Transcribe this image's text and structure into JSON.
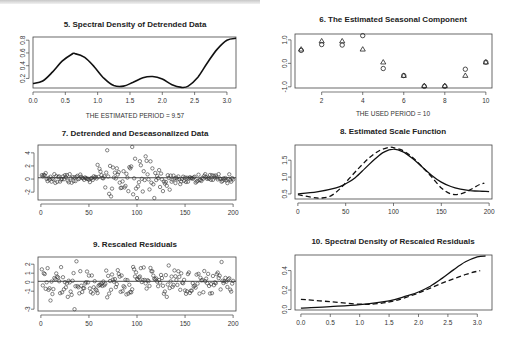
{
  "figure": {
    "panels": [
      {
        "id": "p5",
        "title": "5. Spectral Density of Detrended Data",
        "note": "THE ESTIMATED PERIOD = 9.57"
      },
      {
        "id": "p6",
        "title": "6. The Estimated Seasonal Component",
        "note": "THE USED PERIOD = 10"
      },
      {
        "id": "p7",
        "title": "7. Detrended and Deseasonalized Data"
      },
      {
        "id": "p8",
        "title": "8. Estimated Scale Function"
      },
      {
        "id": "p9",
        "title": "9. Rescaled Residuals"
      },
      {
        "id": "p10",
        "title": "10. Spectral Density of Rescaled Residuals"
      }
    ]
  },
  "chart_data": [
    {
      "type": "line",
      "title": "5. Spectral Density of Detrended Data",
      "xlabel": "",
      "ylabel": "",
      "xlim": [
        0,
        3.14
      ],
      "ylim": [
        0.05,
        0.85
      ],
      "xticks": [
        "0.0",
        "0.5",
        "1.0",
        "1.5",
        "2.0",
        "2.5",
        "3.0"
      ],
      "yticks": [
        "0.2",
        "0.4",
        "0.6",
        "0.8"
      ],
      "annotation": "THE ESTIMATED PERIOD = 9.57",
      "series": [
        {
          "name": "spectral density",
          "style": "solid",
          "x": [
            0.0,
            0.15,
            0.3,
            0.45,
            0.6,
            0.65,
            0.8,
            0.95,
            1.1,
            1.25,
            1.4,
            1.55,
            1.7,
            1.85,
            2.0,
            2.15,
            2.3,
            2.4,
            2.55,
            2.7,
            2.85,
            3.0,
            3.14
          ],
          "y": [
            0.12,
            0.16,
            0.3,
            0.47,
            0.58,
            0.59,
            0.53,
            0.38,
            0.2,
            0.09,
            0.08,
            0.14,
            0.21,
            0.23,
            0.19,
            0.1,
            0.06,
            0.08,
            0.22,
            0.45,
            0.66,
            0.8,
            0.83
          ]
        }
      ],
      "grid": false,
      "legend": null
    },
    {
      "type": "scatter",
      "title": "6. The Estimated Seasonal Component",
      "xlim": [
        0.7,
        10.3
      ],
      "ylim": [
        -1.05,
        1.25
      ],
      "xticks": [
        "2",
        "4",
        "6",
        "8",
        "10"
      ],
      "yticks": [
        "-1.0",
        "0.0",
        "1.0"
      ],
      "annotation": "THE USED PERIOD = 10",
      "series": [
        {
          "name": "circles",
          "marker": "circle",
          "x": [
            1,
            2,
            3,
            4,
            5,
            6,
            7,
            8,
            9,
            10
          ],
          "y": [
            0.55,
            0.8,
            0.78,
            1.18,
            -0.22,
            -0.52,
            -0.98,
            -0.98,
            -0.25,
            0.05
          ]
        },
        {
          "name": "triangles",
          "marker": "triangle",
          "x": [
            1,
            2,
            3,
            4,
            5,
            6,
            7,
            8,
            9,
            10
          ],
          "y": [
            0.6,
            0.95,
            0.95,
            0.6,
            0.05,
            -0.52,
            -0.95,
            -0.95,
            -0.52,
            0.05
          ]
        }
      ],
      "grid": false,
      "legend": null
    },
    {
      "type": "scatter",
      "title": "7. Detrended and Deseasonalized Data",
      "xlim": [
        -3,
        203
      ],
      "ylim": [
        -3.2,
        5.2
      ],
      "xticks": [
        "0",
        "50",
        "100",
        "150",
        "200"
      ],
      "yticks": [
        "-2",
        "0",
        "2",
        "4"
      ],
      "hline": 0.2,
      "n_points": 200,
      "description": "Residual scatter around 0; small spread (±0.5) for x<55 and x>140, large spread (-3 to 5) for 60<x<135"
    },
    {
      "type": "line",
      "title": "8. Estimated Scale Function",
      "xlim": [
        -3,
        203
      ],
      "ylim": [
        0.35,
        1.95
      ],
      "xticks": [
        "0",
        "50",
        "100",
        "150",
        "200"
      ],
      "yticks": [
        "0.5",
        "1.0",
        "1.5"
      ],
      "series": [
        {
          "name": "estimated",
          "style": "solid",
          "x": [
            0,
            20,
            40,
            50,
            60,
            70,
            80,
            90,
            100,
            110,
            120,
            130,
            140,
            150,
            160,
            170,
            180,
            190,
            200
          ],
          "y": [
            0.5,
            0.56,
            0.68,
            0.8,
            0.98,
            1.25,
            1.52,
            1.74,
            1.83,
            1.75,
            1.55,
            1.3,
            1.05,
            0.85,
            0.72,
            0.64,
            0.6,
            0.58,
            0.57
          ]
        },
        {
          "name": "true",
          "style": "dashed",
          "x": [
            0,
            15,
            25,
            35,
            45,
            55,
            65,
            75,
            85,
            95,
            100,
            110,
            120,
            130,
            140,
            150,
            160,
            170,
            180,
            190,
            195
          ],
          "y": [
            0.48,
            0.4,
            0.38,
            0.45,
            0.68,
            1.0,
            1.3,
            1.58,
            1.78,
            1.88,
            1.87,
            1.78,
            1.58,
            1.3,
            1.0,
            0.68,
            0.5,
            0.5,
            0.62,
            0.78,
            0.82
          ]
        }
      ]
    },
    {
      "type": "scatter",
      "title": "9. Rescaled Residuals",
      "xlim": [
        -3,
        203
      ],
      "ylim": [
        -3.2,
        2.8
      ],
      "xticks": [
        "0",
        "50",
        "100",
        "150",
        "200"
      ],
      "yticks": [
        "-3",
        "-1",
        "0",
        "1",
        "2"
      ],
      "hline": 0.1,
      "n_points": 200,
      "description": "Homogeneous residual scatter between about -2 and 2, one low point near -3 at x≈35"
    },
    {
      "type": "line",
      "title": "10. Spectral Density of Rescaled Residuals",
      "xlim": [
        -0.1,
        3.25
      ],
      "ylim": [
        -0.005,
        0.56
      ],
      "xticks": [
        "0.0",
        "0.5",
        "1.0",
        "1.5",
        "2.0",
        "2.5",
        "3.0"
      ],
      "yticks": [
        "0.0",
        "0.2",
        "0.4"
      ],
      "series": [
        {
          "name": "estimated",
          "style": "solid",
          "x": [
            0.0,
            0.5,
            1.0,
            1.5,
            1.8,
            2.0,
            2.2,
            2.4,
            2.6,
            2.8,
            3.0,
            3.14
          ],
          "y": [
            0.015,
            0.03,
            0.05,
            0.09,
            0.14,
            0.18,
            0.24,
            0.32,
            0.41,
            0.49,
            0.54,
            0.55
          ]
        },
        {
          "name": "reference",
          "style": "dashed",
          "x": [
            0.0,
            0.5,
            1.0,
            1.3,
            1.6,
            2.0,
            2.4,
            2.8,
            3.05
          ],
          "y": [
            0.105,
            0.08,
            0.055,
            0.06,
            0.09,
            0.17,
            0.27,
            0.36,
            0.4
          ]
        }
      ]
    }
  ]
}
